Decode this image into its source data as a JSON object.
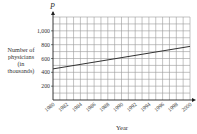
{
  "chart_data": {
    "type": "line",
    "title": "",
    "xlabel": "Year",
    "ylabel": "Number of physicians (in thousands)",
    "y_axis_symbol": "P",
    "ylabel_lines": [
      "Number of",
      "physicians",
      "(in",
      "thousands)"
    ],
    "x_ticks": [
      "1980",
      "1982",
      "1984",
      "1986",
      "1988",
      "1990",
      "1992",
      "1994",
      "1996",
      "1998",
      "2000"
    ],
    "y_ticks": [
      "200",
      "400",
      "600",
      "800",
      "1,000"
    ],
    "y_tick_values": [
      200,
      400,
      600,
      800,
      1000
    ],
    "xlim": [
      1980,
      2000
    ],
    "ylim": [
      0,
      1200
    ],
    "grid": true,
    "series": [
      {
        "name": "Physicians",
        "x": [
          1980,
          2000
        ],
        "values": [
          450,
          775
        ]
      }
    ],
    "line_color": "#333333",
    "grid_color": "#9a9a9a"
  }
}
